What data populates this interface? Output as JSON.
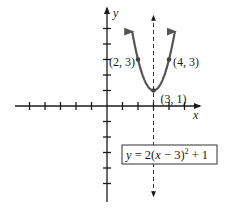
{
  "chart_data": {
    "type": "line",
    "title": "",
    "xlabel": "x",
    "ylabel": "y",
    "xlim": [
      -6,
      5.8
    ],
    "ylim": [
      -6,
      5.8
    ],
    "x_ticks": [
      -5,
      -4,
      -3,
      -2,
      -1,
      1,
      2,
      3,
      4,
      5
    ],
    "y_ticks": [
      -5,
      -4,
      -3,
      -2,
      -1,
      1,
      2,
      3,
      4,
      5
    ],
    "grid": false,
    "series": [
      {
        "name": "parabola",
        "function": "y = 2(x - 3)^2 + 1",
        "vertex": [
          3,
          1
        ],
        "x_range": [
          1.0,
          5.0
        ],
        "color": "#555555"
      }
    ],
    "axis_of_symmetry": {
      "x": 3,
      "style": "dashed"
    },
    "points": [
      {
        "x": 2,
        "y": 3,
        "label": "(2, 3)"
      },
      {
        "x": 4,
        "y": 3,
        "label": "(4, 3)"
      },
      {
        "x": 3,
        "y": 1,
        "label": "(3, 1)"
      }
    ],
    "equation_label": "y = 2(x − 3)² + 1"
  }
}
